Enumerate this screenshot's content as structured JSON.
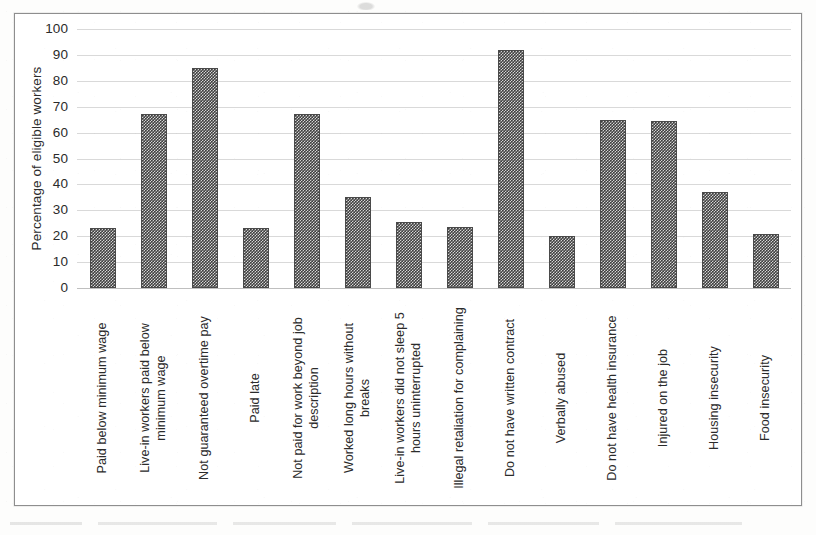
{
  "chart_data": {
    "type": "bar",
    "title": "",
    "xlabel": "",
    "ylabel": "Percentage of eligible workers",
    "ylim": [
      0,
      100
    ],
    "ytick_step": 10,
    "grid": true,
    "legend": false,
    "bar_color": "#3f3f3f",
    "bar_pattern": "dense-checkerboard",
    "yticks": [
      "100",
      "90",
      "80",
      "70",
      "60",
      "50",
      "40",
      "30",
      "20",
      "10",
      "0"
    ],
    "categories": [
      "Paid below minimum wage",
      "Live-in workers paid below minimum wage",
      "Not guaranteed overtime pay",
      "Paid late",
      "Not paid for work beyond job description",
      "Worked long hours without breaks",
      "Live-in workers did not sleep 5 hours uninterrupted",
      "Illegal retaliation for complaining",
      "Do not have written contract",
      "Verbally abused",
      "Do not have health insurance",
      "Injured on the job",
      "Housing insecurity",
      "Food insecurity"
    ],
    "values": [
      23,
      67,
      85,
      23,
      67,
      35,
      25.5,
      23.5,
      92,
      20,
      65,
      64.5,
      37,
      21
    ]
  },
  "axis": {
    "y_title": "Percentage of eligible workers"
  }
}
